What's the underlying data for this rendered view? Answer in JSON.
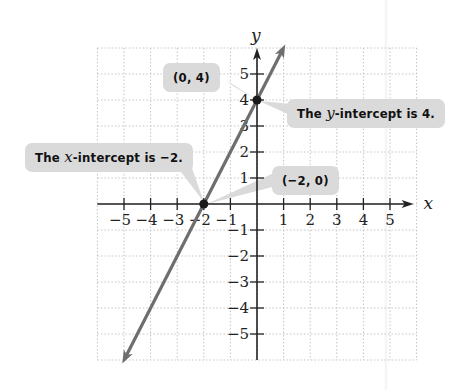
{
  "diagram": {
    "type": "coordinate-graph",
    "equation_depicted": "y = 2x + 4",
    "axes": {
      "x_label": "x",
      "y_label": "y",
      "x_ticks": [
        "−5",
        "−4",
        "−3",
        "−2",
        "−1",
        "1",
        "2",
        "3",
        "4",
        "5"
      ],
      "y_ticks": [
        "5",
        "4",
        "3",
        "2",
        "1",
        "−1",
        "−2",
        "−3",
        "−4",
        "−5"
      ],
      "range": {
        "x": [
          -6,
          6
        ],
        "y": [
          -6,
          6
        ]
      },
      "grid": "dotted"
    },
    "points": [
      {
        "name": "y-intercept",
        "x": 0,
        "y": 4
      },
      {
        "name": "x-intercept",
        "x": -2,
        "y": 0
      }
    ],
    "colors": {
      "line": "#6e6e6e",
      "axis": "#222222",
      "grid": "#c4c4c4",
      "bubble": "#dadada",
      "point": "#1a1a1a"
    }
  },
  "callouts": {
    "y_point": "(0, 4)",
    "y_intercept": {
      "pre": "The ",
      "var": "y",
      "post": "-intercept is 4."
    },
    "x_intercept": {
      "pre": "The ",
      "var": "x",
      "post": "-intercept is −2."
    },
    "x_point": "(−2, 0)"
  }
}
